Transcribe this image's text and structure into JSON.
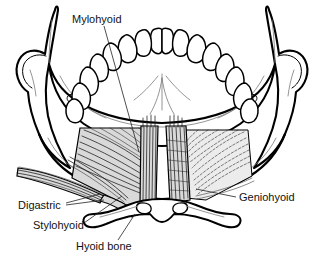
{
  "figure": {
    "background_color": "#ffffff",
    "ink_color": "#000000",
    "muscle_shade_color": "#d9d9d9",
    "width": 324,
    "height": 261
  },
  "labels": [
    {
      "id": "mylohyoid",
      "text": "Mylohyoid",
      "x": 72,
      "y": 20,
      "anchor": "start",
      "leader": "M 104 26 L 139 152"
    },
    {
      "id": "geniohyoid",
      "text": "Geniohyoid",
      "x": 239,
      "y": 198,
      "anchor": "start",
      "leader": "M 236 197 L 196 189"
    },
    {
      "id": "digastric",
      "text": "Digastric",
      "x": 18,
      "y": 206,
      "anchor": "start",
      "leader": "M 66 203 L 100 194 M 66 205 L 104 200"
    },
    {
      "id": "stylohyoid",
      "text": "Stylohyoid",
      "x": 33,
      "y": 226,
      "anchor": "start",
      "leader": "M 84 223 L 122 196"
    },
    {
      "id": "hyoid-bone",
      "text": "Hyoid bone",
      "x": 76,
      "y": 247,
      "anchor": "start",
      "leader": "M 118 240 L 135 214"
    }
  ],
  "structures": [
    {
      "id": "mandible",
      "name": "mandible"
    },
    {
      "id": "ramus-left",
      "name": "left ramus and condyle"
    },
    {
      "id": "ramus-right",
      "name": "right ramus and condyle"
    },
    {
      "id": "dental-arch",
      "name": "dental arch"
    },
    {
      "id": "mylohyoid-muscle",
      "name": "mylohyoid muscle sheet"
    },
    {
      "id": "geniohyoid-muscle",
      "name": "geniohyoid muscle"
    },
    {
      "id": "digastric-muscle",
      "name": "digastric muscle anterior belly"
    },
    {
      "id": "stylohyoid-muscle",
      "name": "stylohyoid muscle"
    },
    {
      "id": "hyoid-bone-structure",
      "name": "hyoid bone"
    }
  ],
  "teeth": {
    "count": 16,
    "description": "mandibular dental arch, inferior view"
  }
}
